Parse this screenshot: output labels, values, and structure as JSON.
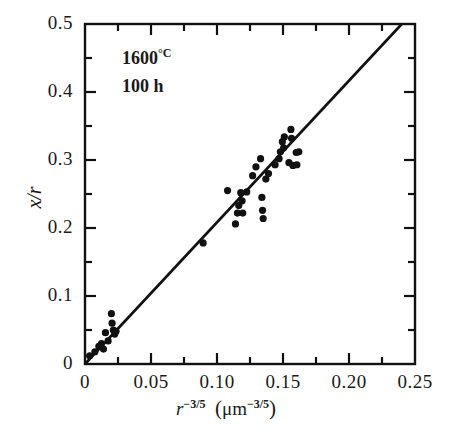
{
  "chart_data": {
    "type": "scatter",
    "title": "",
    "xlabel": "r^-3/5 (μm^-3/5)",
    "ylabel": "x/r",
    "xlim": [
      0,
      0.25
    ],
    "ylim": [
      0,
      0.5
    ],
    "grid": false,
    "legend": null,
    "annotations": [
      "1600 °C",
      "100 h"
    ],
    "xticks": [
      0,
      0.05,
      0.1,
      0.15,
      0.2,
      0.25
    ],
    "xtick_labels": [
      "0",
      "0.05",
      "0.10",
      "0.15",
      "0.20",
      "0.25"
    ],
    "xminor_ticks": [
      0.025,
      0.075,
      0.125,
      0.175,
      0.225
    ],
    "yticks": [
      0,
      0.1,
      0.2,
      0.3,
      0.4,
      0.5
    ],
    "ytick_labels": [
      "0",
      "0.1",
      "0.2",
      "0.3",
      "0.4",
      "0.5"
    ],
    "yminor_ticks": [
      0.05,
      0.15,
      0.25,
      0.35,
      0.45
    ],
    "series": [
      {
        "name": "data",
        "type": "scatter",
        "marker": "filled-circle",
        "color": "#111111",
        "points": [
          [
            0.0035,
            0.012
          ],
          [
            0.0075,
            0.018
          ],
          [
            0.0105,
            0.026
          ],
          [
            0.0125,
            0.03
          ],
          [
            0.014,
            0.022
          ],
          [
            0.0155,
            0.046
          ],
          [
            0.0175,
            0.034
          ],
          [
            0.02,
            0.074
          ],
          [
            0.0205,
            0.06
          ],
          [
            0.0215,
            0.05
          ],
          [
            0.0225,
            0.044
          ],
          [
            0.0235,
            0.048
          ],
          [
            0.0895,
            0.178
          ],
          [
            0.108,
            0.255
          ],
          [
            0.114,
            0.206
          ],
          [
            0.1155,
            0.222
          ],
          [
            0.1165,
            0.233
          ],
          [
            0.118,
            0.252
          ],
          [
            0.119,
            0.24
          ],
          [
            0.1195,
            0.222
          ],
          [
            0.1225,
            0.253
          ],
          [
            0.127,
            0.277
          ],
          [
            0.1295,
            0.29
          ],
          [
            0.133,
            0.302
          ],
          [
            0.134,
            0.245
          ],
          [
            0.1345,
            0.226
          ],
          [
            0.135,
            0.214
          ],
          [
            0.137,
            0.272
          ],
          [
            0.139,
            0.28
          ],
          [
            0.144,
            0.293
          ],
          [
            0.147,
            0.302
          ],
          [
            0.148,
            0.312
          ],
          [
            0.1495,
            0.327
          ],
          [
            0.1505,
            0.318
          ],
          [
            0.151,
            0.334
          ],
          [
            0.1545,
            0.296
          ],
          [
            0.156,
            0.345
          ],
          [
            0.1565,
            0.332
          ],
          [
            0.1575,
            0.292
          ],
          [
            0.16,
            0.311
          ],
          [
            0.1605,
            0.293
          ],
          [
            0.162,
            0.312
          ]
        ]
      },
      {
        "name": "fit-line",
        "type": "line",
        "color": "#111111",
        "x_start": 0.0,
        "y_start": 0.0,
        "x_end": 0.24,
        "y_end": 0.5,
        "slope": 2.083
      }
    ]
  },
  "axes": {
    "y_label_text": "x/r",
    "x_label_var": "r",
    "x_label_exp": "−3/5",
    "x_label_unit_open": "(",
    "x_label_unit_mu": "μm",
    "x_label_unit_exp": "−3/5",
    "x_label_unit_close": ")"
  },
  "annotations": {
    "temperature_value": "1600",
    "temperature_unit": "°C",
    "duration": "100 h"
  }
}
